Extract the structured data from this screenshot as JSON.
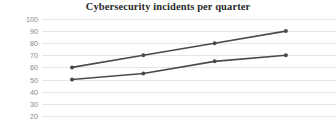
{
  "chart_data": {
    "type": "line",
    "title": "Cybersecurity incidents per quarter",
    "xlabel": "",
    "ylabel": "",
    "ylim": [
      20,
      100
    ],
    "yticks": [
      100,
      90,
      80,
      70,
      60,
      50,
      40,
      30,
      20
    ],
    "grid": true,
    "legend": "none",
    "x": [
      1,
      2,
      3,
      4
    ],
    "series": [
      {
        "name": "series-1",
        "values": [
          60,
          70,
          80,
          90
        ],
        "color": "#4a4a4a"
      },
      {
        "name": "series-2",
        "values": [
          50,
          55,
          65,
          70
        ],
        "color": "#4a4a4a"
      }
    ],
    "note": "Bottom of figure is cropped; no x-axis tick labels or legend are visible."
  },
  "axis": {
    "tick_color": "#8a8a8a",
    "gridline_color": "#e6e6e6"
  }
}
